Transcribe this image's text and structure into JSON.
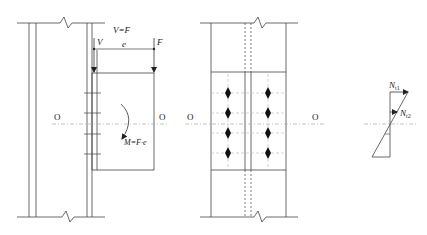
{
  "figure": {
    "caption": "",
    "colors": {
      "line": "#333333",
      "centerline": "#aaaaaa",
      "bolt": "#111111",
      "background": "#ffffff"
    }
  },
  "left_view": {
    "label_v_equals_f": "V=F",
    "label_v": "V",
    "label_f": "F",
    "label_e": "e",
    "label_moment": "M=F·e",
    "axis_label_left": "O",
    "axis_label_right": "O"
  },
  "middle_view": {
    "axis_label_left": "O",
    "axis_label_right": "O",
    "bolt_columns": 2,
    "bolt_rows": 4
  },
  "right_view": {
    "label_nt1_main": "N",
    "label_nt1_sub": "t1",
    "label_nt2_main": "N",
    "label_nt2_sub": "t2"
  }
}
